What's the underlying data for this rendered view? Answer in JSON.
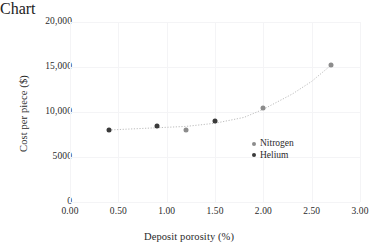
{
  "chart_data": {
    "type": "scatter",
    "title": "",
    "xlabel": "Deposit porosity (%)",
    "ylabel": "Cost per piece ($)",
    "xlim": [
      0.0,
      3.0
    ],
    "ylim": [
      0,
      20000
    ],
    "grid": true,
    "legend_position": "inside-right",
    "xticklabels": [
      "0.00",
      "0.50",
      "1.00",
      "1.50",
      "2.00",
      "2.50",
      "3.00"
    ],
    "xtickvalues": [
      0.0,
      0.5,
      1.0,
      1.5,
      2.0,
      2.5,
      3.0
    ],
    "yticklabels": [
      "0",
      "5000",
      "10,000",
      "15,000",
      "20,000"
    ],
    "ytickvalues": [
      0,
      5000,
      10000,
      15000,
      20000
    ],
    "series": [
      {
        "name": "Nitrogen",
        "color": "#8c8c8c",
        "marker": "circle",
        "points": [
          {
            "x": 1.2,
            "y": 8050
          },
          {
            "x": 2.0,
            "y": 10400
          },
          {
            "x": 2.7,
            "y": 15200
          }
        ]
      },
      {
        "name": "Helium",
        "color": "#3a3a3a",
        "marker": "circle",
        "points": [
          {
            "x": 0.4,
            "y": 8000
          },
          {
            "x": 0.9,
            "y": 8400
          },
          {
            "x": 1.5,
            "y": 9000
          }
        ]
      }
    ],
    "trendline": {
      "style": "dotted",
      "color": "#bdbdbd",
      "points": [
        {
          "x": 0.4,
          "y": 8000
        },
        {
          "x": 0.9,
          "y": 8250
        },
        {
          "x": 1.2,
          "y": 8400
        },
        {
          "x": 1.5,
          "y": 8750
        },
        {
          "x": 1.8,
          "y": 9400
        },
        {
          "x": 2.0,
          "y": 10300
        },
        {
          "x": 2.3,
          "y": 12000
        },
        {
          "x": 2.5,
          "y": 13400
        },
        {
          "x": 2.7,
          "y": 15200
        }
      ]
    },
    "legend": [
      {
        "label": "Nitrogen",
        "color": "#8c8c8c"
      },
      {
        "label": "Helium",
        "color": "#3a3a3a"
      }
    ]
  }
}
